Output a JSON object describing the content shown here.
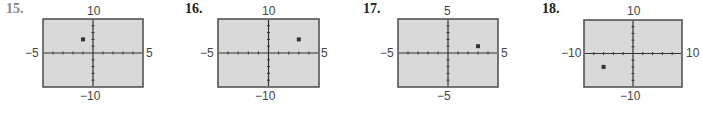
{
  "chart_data": [
    {
      "type": "scatter",
      "label": "15.",
      "xlim": [
        -5,
        5
      ],
      "ylim": [
        -10,
        10
      ],
      "xtick_step": 1,
      "ytick_step": 2,
      "tick_labels": {
        "top": "10",
        "bottom": "−10",
        "left": "−5",
        "right": "5"
      },
      "points": [
        {
          "x": -1,
          "y": 4
        }
      ],
      "grid": false,
      "background": "#d9d9d9"
    },
    {
      "type": "scatter",
      "label": "16.",
      "xlim": [
        -5,
        5
      ],
      "ylim": [
        -10,
        10
      ],
      "xtick_step": 1,
      "ytick_step": 2,
      "tick_labels": {
        "top": "10",
        "bottom": "−10",
        "left": "−5",
        "right": "5"
      },
      "points": [
        {
          "x": 3,
          "y": 4
        }
      ],
      "grid": false,
      "background": "#d9d9d9"
    },
    {
      "type": "scatter",
      "label": "17.",
      "xlim": [
        -5,
        5
      ],
      "ylim": [
        -5,
        5
      ],
      "xtick_step": 1,
      "ytick_step": 1,
      "tick_labels": {
        "top": "5",
        "bottom": "−5",
        "left": "−5",
        "right": "5"
      },
      "points": [
        {
          "x": 3,
          "y": 1
        }
      ],
      "grid": false,
      "background": "#d9d9d9"
    },
    {
      "type": "scatter",
      "label": "18.",
      "xlim": [
        -10,
        10
      ],
      "ylim": [
        -10,
        10
      ],
      "xtick_step": 2,
      "ytick_step": 2,
      "tick_labels": {
        "top": "10",
        "bottom": "−10",
        "left": "−10",
        "right": "10"
      },
      "points": [
        {
          "x": -6,
          "y": -4
        }
      ],
      "grid": false,
      "background": "#d9d9d9"
    }
  ],
  "panels": [
    {
      "label": "15.",
      "top": "10",
      "bottom": "−10",
      "left": "−5",
      "right": "5"
    },
    {
      "label": "16.",
      "top": "10",
      "bottom": "−10",
      "left": "−5",
      "right": "5"
    },
    {
      "label": "17.",
      "top": "5",
      "bottom": "−5",
      "left": "−5",
      "right": "5"
    },
    {
      "label": "18.",
      "top": "10",
      "bottom": "−10",
      "left": "−10",
      "right": "10"
    }
  ]
}
